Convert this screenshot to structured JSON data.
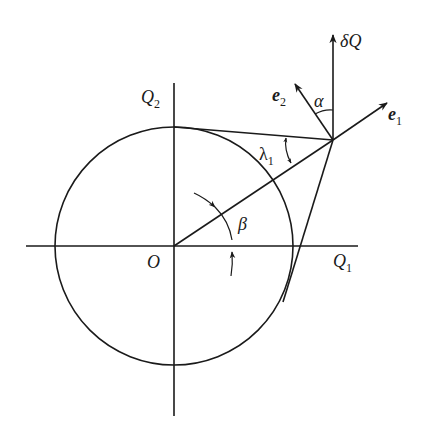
{
  "figure": {
    "colors": {
      "ink": "#1a1a1a",
      "background": "#ffffff"
    }
  },
  "labels": {
    "origin": "O",
    "q1_main": "Q",
    "q1_sub": "1",
    "q2_main": "Q",
    "q2_sub": "2",
    "e1_main": "e",
    "e1_sub": "1",
    "e2_main": "e",
    "e2_sub": "2",
    "deltaQ_delta": "δ",
    "deltaQ_main": "Q",
    "alpha": "α",
    "beta": "β",
    "lambda_main": "λ",
    "lambda_sub": "1"
  }
}
